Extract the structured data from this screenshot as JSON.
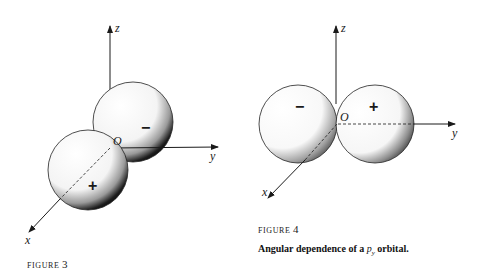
{
  "figure3": {
    "label_word": "FIGURE",
    "label_number": "3",
    "axes": {
      "z": "z",
      "y": "y",
      "x": "x",
      "origin": "O"
    },
    "lobes": [
      {
        "position": "upper-back",
        "sign": "−"
      },
      {
        "position": "lower-front",
        "sign": "+"
      }
    ]
  },
  "figure4": {
    "label_word": "FIGURE",
    "label_number": "4",
    "axes": {
      "z": "z",
      "y": "y",
      "x": "x",
      "origin": "O"
    },
    "lobes": [
      {
        "position": "left",
        "sign": "−"
      },
      {
        "position": "right",
        "sign": "+"
      }
    ],
    "caption_prefix": "Angular dependence of a ",
    "caption_orbital": "p",
    "caption_subscript": "y",
    "caption_suffix": " orbital."
  }
}
